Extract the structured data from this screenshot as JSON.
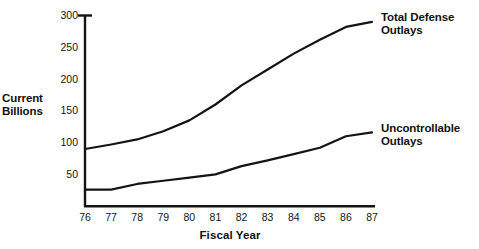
{
  "chart_data": {
    "type": "line",
    "title": "",
    "subtitle": "",
    "xlabel": "Fiscal Year",
    "ylabel": "Current Billions",
    "ylabel_lines": [
      "Current",
      "Billions"
    ],
    "x": [
      76,
      77,
      78,
      79,
      80,
      81,
      82,
      83,
      84,
      85,
      86,
      87
    ],
    "categories": [
      "76",
      "77",
      "78",
      "79",
      "80",
      "81",
      "82",
      "83",
      "84",
      "85",
      "86",
      "87"
    ],
    "yticks": [
      50,
      100,
      150,
      200,
      250,
      300
    ],
    "ytick_labels": [
      "50",
      "100",
      "150",
      "200",
      "250",
      "300"
    ],
    "ylim": [
      0,
      300
    ],
    "xlim": [
      76,
      87
    ],
    "grid": false,
    "legend_position": "right-inline",
    "line_color": "#141414",
    "axis_color": "#141414",
    "background": "#ffffff",
    "series": [
      {
        "name": "Total Defense Outlays",
        "name_lines": [
          "Total Defense",
          "Outlays"
        ],
        "values": [
          90,
          97,
          105,
          118,
          135,
          160,
          190,
          215,
          240,
          262,
          282,
          290
        ]
      },
      {
        "name": "Uncontrollable Outlays",
        "name_lines": [
          "Uncontrollable",
          "Outlays"
        ],
        "values": [
          26,
          26,
          35,
          40,
          45,
          50,
          63,
          72,
          82,
          92,
          110,
          116
        ]
      }
    ]
  },
  "annotations": {
    "top_axis_tick": "300"
  }
}
